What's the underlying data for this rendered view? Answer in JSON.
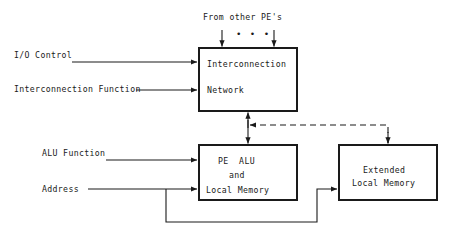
{
  "diagram": {
    "title_note": "From other PE's",
    "boxes": [
      {
        "id": "interconnection-network",
        "name": "Interconnection Network",
        "line1": "Interconnection",
        "line2": "Network",
        "x": 199,
        "y": 48,
        "w": 98,
        "h": 63
      },
      {
        "id": "pe-alu-local-memory",
        "name": "PE ALU and Local Memory",
        "line1": "PE  ALU",
        "line2": "and",
        "line3": "Local Memory",
        "x": 199,
        "y": 145,
        "w": 98,
        "h": 55
      },
      {
        "id": "extended-local-memory",
        "name": "Extended Local Memory",
        "line1": "Extended",
        "line2": "Local Memory",
        "x": 339,
        "y": 145,
        "w": 98,
        "h": 55
      }
    ],
    "input_labels": [
      {
        "id": "io-control",
        "text": "I/O Control",
        "x": 14,
        "y": 50
      },
      {
        "id": "interconnection-function",
        "text": "Interconnection Function",
        "x": 14,
        "y": 84
      },
      {
        "id": "alu-function",
        "text": "ALU Function",
        "x": 42,
        "y": 148
      },
      {
        "id": "address",
        "text": "Address",
        "x": 42,
        "y": 182
      }
    ],
    "ellipsis": "• • •",
    "colors": {
      "stroke": "#1a1a1a",
      "text": "#1a1a1a",
      "background": "#ffffff"
    },
    "connections": [
      {
        "id": "from-other-pes-left",
        "style": "solid",
        "direction": "down"
      },
      {
        "id": "from-other-pes-right",
        "style": "solid",
        "direction": "down"
      },
      {
        "id": "io-control-to-network",
        "style": "solid",
        "direction": "right"
      },
      {
        "id": "interconnection-function-to-network",
        "style": "solid",
        "direction": "right"
      },
      {
        "id": "network-to-pe-alu",
        "style": "solid",
        "direction": "bidirectional"
      },
      {
        "id": "alu-function-to-pe-alu",
        "style": "solid",
        "direction": "right"
      },
      {
        "id": "address-to-pe-alu",
        "style": "solid",
        "direction": "right"
      },
      {
        "id": "address-to-extended-memory",
        "style": "solid",
        "direction": "right"
      },
      {
        "id": "extended-memory-to-network",
        "style": "dashed",
        "direction": "bidirectional"
      }
    ]
  }
}
